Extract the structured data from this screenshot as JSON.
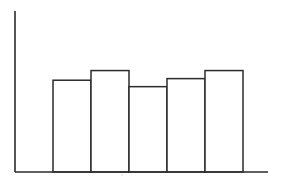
{
  "chart_data": {
    "type": "bar",
    "title": "",
    "xlabel": "",
    "ylabel": "",
    "categories": [
      "",
      "",
      "",
      "",
      ""
    ],
    "values": [
      57,
      63,
      53,
      58,
      63
    ],
    "ylim": [
      0,
      100
    ],
    "grid": false,
    "legend": "none",
    "bar_fill": "#ffffff",
    "bar_stroke": "#2b2b2b"
  }
}
